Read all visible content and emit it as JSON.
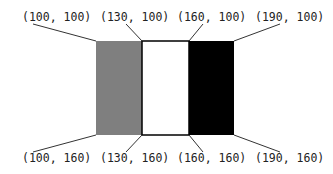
{
  "diagram": {
    "rectangles": [
      {
        "name": "gray-rect",
        "fill": "#7f7f7f",
        "stroke": "none",
        "x": 96,
        "y": 41,
        "w": 46,
        "h": 94
      },
      {
        "name": "white-rect",
        "fill": "#ffffff",
        "stroke": "#000000",
        "x": 142,
        "y": 41,
        "w": 47,
        "h": 94
      },
      {
        "name": "black-rect",
        "fill": "#000000",
        "stroke": "none",
        "x": 189,
        "y": 41,
        "w": 45,
        "h": 94
      }
    ],
    "labels": {
      "top": [
        "(100, 100)",
        "(130, 100)",
        "(160, 100)",
        "(190, 100)"
      ],
      "bottom": [
        "(100, 160)",
        "(130, 160)",
        "(160, 160)",
        "(190, 160)"
      ]
    }
  }
}
